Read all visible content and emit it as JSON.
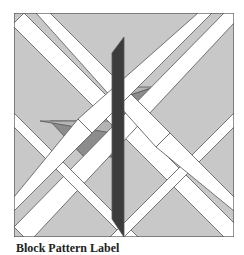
{
  "diagram": {
    "type": "quilt-block",
    "colors": {
      "background": "#c8c8c8",
      "lattice": "#ffffff",
      "leaf": "#8c8c8c",
      "leaf_light": "#b4b4b4",
      "stem": "#3c3c3c",
      "outline": "#555555"
    }
  },
  "caption": {
    "text": "Block Pattern Label"
  }
}
